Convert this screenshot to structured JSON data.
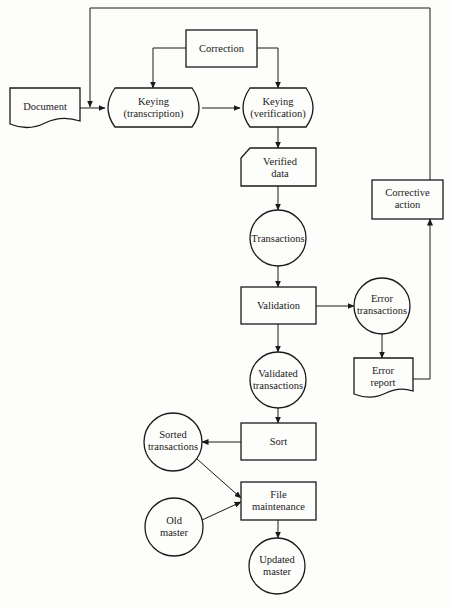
{
  "diagram": {
    "type": "system flowchart",
    "nodes": {
      "document": {
        "label": "Document",
        "shape": "document"
      },
      "correction": {
        "label": "Correction",
        "shape": "process"
      },
      "keying_transcription": {
        "line1": "Keying",
        "line2": "(transcription)",
        "shape": "manual-input"
      },
      "keying_verification": {
        "line1": "Keying",
        "line2": "(verification)",
        "shape": "manual-input"
      },
      "verified_data": {
        "line1": "Verified",
        "line2": "data",
        "shape": "card"
      },
      "transactions": {
        "label": "Transactions",
        "shape": "connector-circle"
      },
      "validation": {
        "label": "Validation",
        "shape": "process"
      },
      "error_transactions": {
        "line1": "Error",
        "line2": "transactions",
        "shape": "connector-circle"
      },
      "error_report": {
        "line1": "Error",
        "line2": "report",
        "shape": "document"
      },
      "corrective_action": {
        "line1": "Corrective",
        "line2": "action",
        "shape": "process"
      },
      "validated_transactions": {
        "line1": "Validated",
        "line2": "transactions",
        "shape": "connector-circle"
      },
      "sort": {
        "label": "Sort",
        "shape": "process"
      },
      "sorted_transactions": {
        "line1": "Sorted",
        "line2": "transactions",
        "shape": "connector-circle"
      },
      "file_maintenance": {
        "line1": "File",
        "line2": "maintenance",
        "shape": "process"
      },
      "old_master": {
        "line1": "Old",
        "line2": "master",
        "shape": "connector-circle"
      },
      "updated_master": {
        "line1": "Updated",
        "line2": "master",
        "shape": "connector-circle"
      }
    },
    "edges": [
      [
        "Document",
        "Keying (transcription)"
      ],
      [
        "Keying (transcription)",
        "Keying (verification)"
      ],
      [
        "Correction",
        "Keying (transcription)"
      ],
      [
        "Correction",
        "Keying (verification)"
      ],
      [
        "Keying (verification)",
        "Verified data"
      ],
      [
        "Verified data",
        "Transactions"
      ],
      [
        "Transactions",
        "Validation"
      ],
      [
        "Validation",
        "Error transactions"
      ],
      [
        "Error transactions",
        "Error report"
      ],
      [
        "Error report",
        "Corrective action"
      ],
      [
        "Corrective action",
        "Keying (transcription)"
      ],
      [
        "Validation",
        "Validated transactions"
      ],
      [
        "Validated transactions",
        "Sort"
      ],
      [
        "Sort",
        "Sorted transactions"
      ],
      [
        "Sorted transactions",
        "File maintenance"
      ],
      [
        "Old master",
        "File maintenance"
      ],
      [
        "File maintenance",
        "Updated master"
      ]
    ]
  }
}
